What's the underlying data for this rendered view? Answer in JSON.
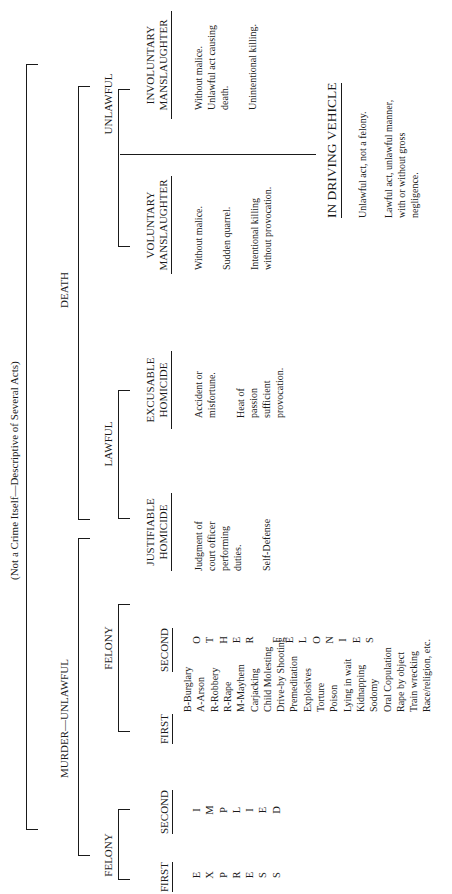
{
  "diagram": {
    "title": "(Not a Crime Itself—Descriptive of Several Acts)",
    "root": "DEATH",
    "murder": {
      "label": "MURDER—UNLAWFUL",
      "felony_left": {
        "label": "FELONY",
        "first_header": "FIRST",
        "second_header": "SECOND",
        "first_letters": [
          "E",
          "X",
          "P",
          "R",
          "E",
          "S",
          "S"
        ],
        "second_letters": [
          "I",
          "M",
          "P",
          "L",
          "I",
          "E",
          "D"
        ]
      },
      "felony_right": {
        "label": "FELONY",
        "first_header": "FIRST",
        "second_header": "SECOND",
        "first_items": [
          "B-Burglary",
          "A-Arson",
          "R-Robbery",
          "R-Rape",
          "M-Mayhem",
          "Carjacking",
          "Child Molesting",
          "Drive-by Shooting",
          "Premeditation",
          "Explosives",
          "Torture",
          "Poison",
          "Lying in wait",
          "Kidnapping",
          "Sodomy",
          "Oral Copulation",
          "Rape by object",
          "Train wrecking",
          "Race/religion, etc."
        ],
        "second_letters": [
          "O",
          "T",
          "H",
          "E",
          "R",
          "",
          "F",
          "E",
          "L",
          "O",
          "N",
          "I",
          "E",
          "S"
        ]
      }
    },
    "lawful": {
      "label": "LAWFUL",
      "justifiable": {
        "header_line1": "JUSTIFIABLE",
        "header_line2": "HOMICIDE",
        "notes": [
          [
            "Judgment of",
            "court officer",
            "performing",
            "duties."
          ],
          [
            "Self-Defense"
          ]
        ]
      },
      "excusable": {
        "header_line1": "EXCUSABLE",
        "header_line2": "HOMICIDE",
        "notes": [
          [
            "Accident or",
            "misfortune."
          ],
          [
            "Heat of",
            "passion",
            "sufficient",
            "provocation."
          ]
        ]
      }
    },
    "unlawful": {
      "label": "UNLAWFUL",
      "voluntary": {
        "header_line1": "VOLUNTARY",
        "header_line2": "MANSLAUGHTER",
        "notes": [
          [
            "Without malice."
          ],
          [
            "Sudden quarrel."
          ],
          [
            "Intentional killing",
            "without provocation."
          ]
        ]
      },
      "involuntary": {
        "header_line1": "INVOLUNTARY",
        "header_line2": "MANSLAUGHTER",
        "notes": [
          [
            "Without malice.",
            "Unlawful act causing",
            "death."
          ],
          [
            "Unintentional killing."
          ]
        ]
      },
      "vehicle": {
        "header": "IN DRIVING VEHICLE",
        "notes": [
          [
            "Unlawful act, not a felony."
          ],
          [
            "Lawful act, unlawful manner,",
            "with or without gross",
            "negligence."
          ]
        ]
      }
    }
  }
}
